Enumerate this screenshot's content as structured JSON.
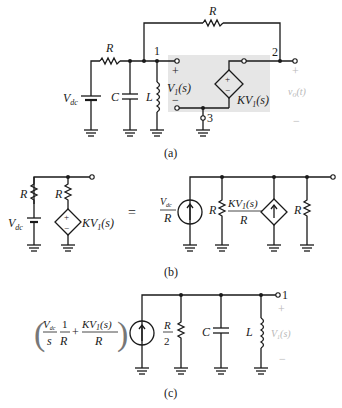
{
  "figure": {
    "panels": [
      {
        "id": "a",
        "caption": "(a)",
        "components": {
          "top_resistor": "R",
          "series_resistor": "R",
          "source": "V",
          "source_sub": "dc",
          "capacitor": "C",
          "inductor": "L",
          "node1": "1",
          "node2": "2",
          "node3": "3",
          "v1_plus": "+",
          "v1_minus": "−",
          "v1_label": "V",
          "v1_sub": "1",
          "v1_arg": "(s)",
          "dep_source_label": "KV",
          "dep_source_sub": "1",
          "dep_source_arg": "(s)",
          "dep_plus": "+",
          "dep_minus": "−",
          "out_plus": "+",
          "out_minus": "−",
          "out_label": "v",
          "out_sub": "o",
          "out_arg": "(t)"
        }
      },
      {
        "id": "b",
        "caption": "(b)",
        "equals": "=",
        "left": {
          "r1": "R",
          "r2": "R",
          "source": "V",
          "source_sub": "dc",
          "dep_label": "KV",
          "dep_sub": "1",
          "dep_arg": "(s)"
        },
        "right": {
          "src_num": "V",
          "src_num_sub": "dc",
          "src_den": "R",
          "r1": "R",
          "dep_num": "KV",
          "dep_num_sub": "1",
          "dep_num_arg": "(s)",
          "dep_den": "R",
          "r2": "R"
        }
      },
      {
        "id": "c",
        "caption": "(c)",
        "expr": {
          "f1_num": "V",
          "f1_num_sub": "dc",
          "f1_den": "s",
          "f2_num": "1",
          "f2_den": "R",
          "plus": "+",
          "f3_num": "KV",
          "f3_num_sub": "1",
          "f3_num_arg": "(s)",
          "f3_den": "R"
        },
        "half_r_num": "R",
        "half_r_den": "2",
        "capacitor": "C",
        "inductor": "L",
        "node": "1",
        "plus": "+",
        "minus": "−",
        "v_label": "V",
        "v_sub": "1",
        "v_arg": "(s)"
      }
    ]
  }
}
